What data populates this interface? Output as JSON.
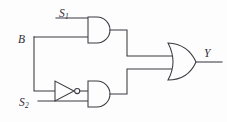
{
  "diagram": {
    "background_color": "#fdfdfd",
    "line_color": "#3a3a42"
  },
  "labels": {
    "s1": {
      "main": "S",
      "sub": "1"
    },
    "b": {
      "main": "B",
      "sub": ""
    },
    "s2": {
      "main": "S",
      "sub": "2"
    },
    "y": {
      "main": "Y",
      "sub": ""
    }
  },
  "gates": [
    {
      "id": "and-top",
      "type": "AND",
      "inputs": [
        "s1",
        "b"
      ],
      "output": "or-gate"
    },
    {
      "id": "inverter",
      "type": "NOT",
      "inputs": [
        "b"
      ],
      "output": "and-bottom"
    },
    {
      "id": "and-bottom",
      "type": "AND",
      "inputs": [
        "inverter",
        "s2"
      ],
      "output": "or-gate"
    },
    {
      "id": "or-gate",
      "type": "OR",
      "inputs": [
        "and-top",
        "and-bottom"
      ],
      "output": "y"
    }
  ],
  "nets": [
    {
      "name": "S1",
      "from": "s1-input",
      "to": "and-top.in1"
    },
    {
      "name": "B",
      "from": "b-input",
      "to": "and-top.in2"
    },
    {
      "name": "B-branch",
      "from": "b-junction",
      "to": "inverter.in"
    },
    {
      "name": "S2",
      "from": "s2-input",
      "to": "and-bottom.in2"
    },
    {
      "name": "AND-top-out",
      "from": "and-top.out",
      "to": "or-gate.in1"
    },
    {
      "name": "AND-bottom-out",
      "from": "and-bottom.out",
      "to": "or-gate.in2"
    },
    {
      "name": "Y",
      "from": "or-gate.out",
      "to": "y-output"
    }
  ]
}
